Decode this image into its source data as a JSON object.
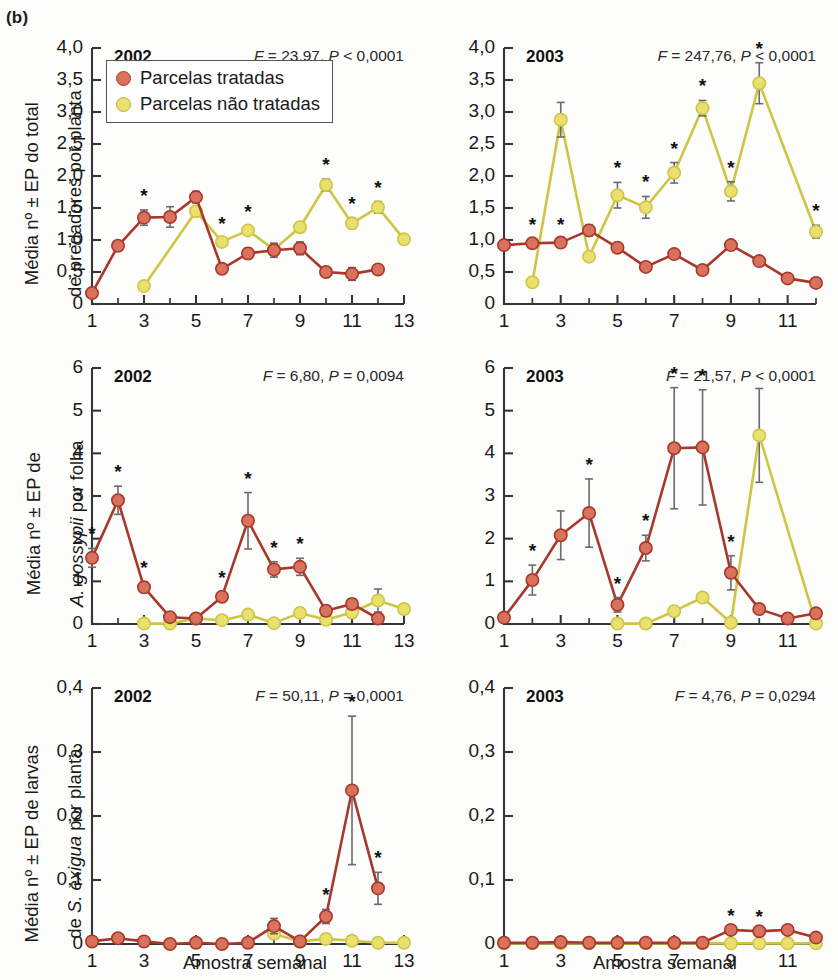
{
  "figure": {
    "panel_label": "(b)",
    "x_axis_title": "Amostra semanal",
    "colors": {
      "treated": "#d9725c",
      "treated_line": "#a8372c",
      "untreated": "#e9e070",
      "untreated_line": "#cfc545",
      "axis": "#35363a",
      "error_bar": "#6a6a70",
      "background": "#fdfdfb"
    },
    "legend": {
      "items": [
        {
          "label": "Parcelas tratadas",
          "color": "#d9725c"
        },
        {
          "label": "Parcelas não tratadas",
          "color": "#e9e070"
        }
      ]
    },
    "significance_marker": "*"
  },
  "chart_data": [
    {
      "id": "predators-2002",
      "type": "line",
      "title": "2002",
      "stats": {
        "F_label": "F",
        "F_value": "23,97",
        "P_label": "P",
        "P_op": "<",
        "P_value": "0,0001",
        "text": "F = 23,97, P < 0,0001"
      },
      "ylabel": "Média nº ± EP do total de predadores por planta",
      "xlabel": "Amostra semanal",
      "ylim": [
        0,
        4.0
      ],
      "xlim": [
        1,
        13
      ],
      "yticks": [
        0,
        0.5,
        1.0,
        1.5,
        2.0,
        2.5,
        3.0,
        3.5,
        4.0
      ],
      "yticklabels": [
        "0",
        "0,5",
        "1,0",
        "1,5",
        "2,0",
        "2,5",
        "3,0",
        "3,5",
        "4,0"
      ],
      "xticks": [
        1,
        3,
        5,
        7,
        9,
        11,
        13
      ],
      "xticklabels": [
        "1",
        "3",
        "5",
        "7",
        "9",
        "11",
        "13"
      ],
      "grid": false,
      "legend_position": "upper-left",
      "series": [
        {
          "name": "Parcelas tratadas",
          "color": "#d9725c",
          "x": [
            1,
            2,
            3,
            4,
            5,
            6,
            7,
            8,
            9,
            10,
            11,
            12
          ],
          "values": [
            0.17,
            0.91,
            1.35,
            1.36,
            1.67,
            0.55,
            0.79,
            0.84,
            0.87,
            0.5,
            0.47,
            0.54
          ],
          "errors": [
            0.0,
            0.07,
            0.12,
            0.16,
            0.09,
            0.07,
            0.08,
            0.11,
            0.1,
            0.06,
            0.1,
            0.06
          ],
          "stars": [
            false,
            false,
            true,
            false,
            false,
            false,
            false,
            false,
            false,
            false,
            false,
            false
          ]
        },
        {
          "name": "Parcelas não tratadas",
          "color": "#e9e070",
          "x": [
            3,
            4,
            5,
            6,
            7,
            8,
            9,
            10,
            11,
            12,
            13
          ],
          "values": [
            0.28,
            null,
            1.45,
            0.97,
            1.15,
            0.85,
            1.2,
            1.86,
            1.26,
            1.51,
            1.01
          ],
          "errors": [
            0.0,
            0.0,
            0.07,
            0.06,
            0.07,
            0.08,
            0.07,
            0.09,
            0.08,
            0.09,
            0.07
          ],
          "stars": [
            false,
            false,
            false,
            true,
            true,
            false,
            false,
            true,
            true,
            true,
            false
          ]
        }
      ]
    },
    {
      "id": "predators-2003",
      "type": "line",
      "title": "2003",
      "stats": {
        "F_label": "F",
        "F_value": "247,76",
        "P_label": "P",
        "P_op": "<",
        "P_value": "0,0001",
        "text": "F = 247,76, P < 0,0001"
      },
      "ylabel": "Média nº ± EP do total de predadores por planta",
      "xlabel": "Amostra semanal",
      "ylim": [
        0,
        4.0
      ],
      "xlim": [
        1,
        12
      ],
      "yticks": [
        0,
        0.5,
        1.0,
        1.5,
        2.0,
        2.5,
        3.0,
        3.5,
        4.0
      ],
      "yticklabels": [
        "0",
        "0,5",
        "1,0",
        "1,5",
        "2,0",
        "2,5",
        "3,0",
        "3,5",
        "4,0"
      ],
      "xticks": [
        1,
        3,
        5,
        7,
        9,
        11
      ],
      "xticklabels": [
        "1",
        "3",
        "5",
        "7",
        "9",
        "11"
      ],
      "grid": false,
      "legend_position": "none",
      "series": [
        {
          "name": "Parcelas tratadas",
          "color": "#d9725c",
          "x": [
            1,
            2,
            3,
            4,
            5,
            6,
            7,
            8,
            9,
            10,
            11,
            12
          ],
          "values": [
            0.92,
            0.95,
            0.96,
            1.15,
            0.88,
            0.58,
            0.78,
            0.53,
            0.92,
            0.67,
            0.4,
            0.33
          ],
          "errors": [
            0.0,
            0.06,
            0.06,
            0.09,
            0.0,
            0.0,
            0.0,
            0.0,
            0.0,
            0.0,
            0.0,
            0.0
          ],
          "stars": [
            false,
            true,
            true,
            false,
            false,
            false,
            false,
            false,
            false,
            false,
            false,
            false
          ]
        },
        {
          "name": "Parcelas não tratadas",
          "color": "#e9e070",
          "x": [
            2,
            3,
            4,
            5,
            6,
            7,
            8,
            9,
            10,
            12
          ],
          "values": [
            0.34,
            2.88,
            0.74,
            1.7,
            1.51,
            2.05,
            3.06,
            1.76,
            3.45,
            1.13
          ],
          "errors": [
            0.0,
            0.27,
            0.07,
            0.2,
            0.17,
            0.16,
            0.12,
            0.15,
            0.32,
            0.1
          ],
          "stars": [
            false,
            false,
            false,
            true,
            true,
            true,
            true,
            true,
            true,
            true
          ]
        }
      ]
    },
    {
      "id": "gossypii-2002",
      "type": "line",
      "title": "2002",
      "stats": {
        "F_label": "F",
        "F_value": "6,80",
        "P_label": "P",
        "P_op": "=",
        "P_value": "0,0094",
        "text": "F = 6,80, P = 0,0094"
      },
      "ylabel": "Média nº ± EP de A. gossypii por folha",
      "xlabel": "Amostra semanal",
      "ylim": [
        0,
        6
      ],
      "xlim": [
        1,
        13
      ],
      "yticks": [
        0,
        1,
        2,
        3,
        4,
        5,
        6
      ],
      "yticklabels": [
        "0",
        "1",
        "2",
        "3",
        "4",
        "5",
        "6"
      ],
      "xticks": [
        1,
        3,
        5,
        7,
        9,
        11,
        13
      ],
      "xticklabels": [
        "1",
        "3",
        "5",
        "7",
        "9",
        "11",
        "13"
      ],
      "grid": false,
      "legend_position": "none",
      "series": [
        {
          "name": "Parcelas tratadas",
          "color": "#d9725c",
          "x": [
            1,
            2,
            3,
            4,
            5,
            6,
            7,
            8,
            9,
            10,
            11,
            12
          ],
          "values": [
            1.55,
            2.9,
            0.86,
            0.16,
            0.13,
            0.64,
            2.42,
            1.28,
            1.34,
            0.31,
            0.47,
            0.13
          ],
          "errors": [
            0.22,
            0.33,
            0.12,
            0.08,
            0.08,
            0.1,
            0.66,
            0.18,
            0.2,
            0.12,
            0.12,
            0.07
          ],
          "stars": [
            true,
            true,
            true,
            false,
            false,
            true,
            true,
            true,
            true,
            false,
            false,
            false
          ]
        },
        {
          "name": "Parcelas não tratadas",
          "color": "#e9e070",
          "x": [
            3,
            4,
            5,
            6,
            7,
            8,
            9,
            10,
            11,
            12,
            13
          ],
          "values": [
            0.01,
            0.01,
            0.13,
            0.09,
            0.22,
            0.02,
            0.26,
            0.1,
            0.27,
            0.55,
            0.35
          ],
          "errors": [
            0.0,
            0.0,
            0.0,
            0.0,
            0.0,
            0.0,
            0.0,
            0.0,
            0.12,
            0.27,
            0.11
          ],
          "stars": [
            false,
            false,
            false,
            false,
            false,
            false,
            false,
            false,
            false,
            false,
            false
          ]
        }
      ]
    },
    {
      "id": "gossypii-2003",
      "type": "line",
      "title": "2003",
      "stats": {
        "F_label": "F",
        "F_value": "21,57",
        "P_label": "P",
        "P_op": "<",
        "P_value": "0,0001",
        "text": "F = 21,57, P < 0,0001"
      },
      "ylabel": "Média nº ± EP de A. gossypii por folha",
      "xlabel": "Amostra semanal",
      "ylim": [
        0,
        6
      ],
      "xlim": [
        1,
        12
      ],
      "yticks": [
        0,
        1,
        2,
        3,
        4,
        5,
        6
      ],
      "yticklabels": [
        "0",
        "1",
        "2",
        "3",
        "4",
        "5",
        "6"
      ],
      "xticks": [
        1,
        3,
        5,
        7,
        9,
        11
      ],
      "xticklabels": [
        "1",
        "3",
        "5",
        "7",
        "9",
        "11"
      ],
      "grid": false,
      "legend_position": "none",
      "series": [
        {
          "name": "Parcelas tratadas",
          "color": "#d9725c",
          "x": [
            1,
            2,
            3,
            4,
            5,
            6,
            7,
            8,
            9,
            10,
            11,
            12
          ],
          "values": [
            0.15,
            1.03,
            2.08,
            2.6,
            0.45,
            1.78,
            4.12,
            4.14,
            1.2,
            0.35,
            0.13,
            0.25
          ],
          "errors": [
            0.0,
            0.35,
            0.57,
            0.8,
            0.17,
            0.3,
            1.42,
            1.35,
            0.4,
            0.0,
            0.0,
            0.0
          ],
          "stars": [
            false,
            true,
            false,
            true,
            true,
            true,
            true,
            true,
            true,
            false,
            false,
            false
          ]
        },
        {
          "name": "Parcelas não tratadas",
          "color": "#e9e070",
          "x": [
            5,
            6,
            7,
            8,
            9,
            10,
            12
          ],
          "values": [
            0.01,
            0.01,
            0.3,
            0.62,
            0.03,
            4.42,
            0.01
          ],
          "errors": [
            0.0,
            0.0,
            0.0,
            0.0,
            0.0,
            1.1,
            0.0
          ],
          "stars": [
            false,
            false,
            false,
            false,
            false,
            false,
            false
          ]
        }
      ]
    },
    {
      "id": "exigua-2002",
      "type": "line",
      "title": "2002",
      "stats": {
        "F_label": "F",
        "F_value": "50,11",
        "P_label": "P",
        "P_op": "=",
        "P_value": "0,0001",
        "text": "F = 50,11, P = 0,0001"
      },
      "ylabel": "Média nº ± EP de larvas de S. exigua por planta",
      "xlabel": "Amostra semanal",
      "ylim": [
        0,
        0.4
      ],
      "xlim": [
        1,
        13
      ],
      "yticks": [
        0,
        0.1,
        0.2,
        0.3,
        0.4
      ],
      "yticklabels": [
        "0",
        "0,1",
        "0,2",
        "0,3",
        "0,4"
      ],
      "xticks": [
        1,
        3,
        5,
        7,
        9,
        11,
        13
      ],
      "xticklabels": [
        "1",
        "3",
        "5",
        "7",
        "9",
        "11",
        "13"
      ],
      "grid": false,
      "legend_position": "none",
      "series": [
        {
          "name": "Parcelas tratadas",
          "color": "#d9725c",
          "x": [
            1,
            2,
            3,
            4,
            5,
            6,
            7,
            8,
            9,
            10,
            11,
            12
          ],
          "values": [
            0.004,
            0.009,
            0.004,
            0.0,
            0.002,
            0.0,
            0.002,
            0.028,
            0.004,
            0.043,
            0.24,
            0.087
          ],
          "errors": [
            0.0,
            0.0,
            0.0,
            0.0,
            0.0,
            0.0,
            0.0,
            0.012,
            0.0,
            0.011,
            0.116,
            0.025
          ],
          "stars": [
            false,
            false,
            false,
            false,
            false,
            false,
            false,
            false,
            false,
            true,
            true,
            true
          ]
        },
        {
          "name": "Parcelas não tratadas",
          "color": "#e9e070",
          "x": [
            8,
            9,
            10,
            11,
            12,
            13
          ],
          "values": [
            0.016,
            0.004,
            0.008,
            0.005,
            0.002,
            0.002
          ],
          "errors": [
            0.0,
            0.0,
            0.0,
            0.0,
            0.0,
            0.0
          ],
          "stars": [
            false,
            false,
            false,
            false,
            false,
            false
          ]
        }
      ]
    },
    {
      "id": "exigua-2003",
      "type": "line",
      "title": "2003",
      "stats": {
        "F_label": "F",
        "F_value": "4,76",
        "P_label": "P",
        "P_op": "=",
        "P_value": "0,0294",
        "text": "F = 4,76, P = 0,0294"
      },
      "ylabel": "Média nº ± EP de larvas de S. exigua por planta",
      "xlabel": "Amostra semanal",
      "ylim": [
        0,
        0.4
      ],
      "xlim": [
        1,
        12
      ],
      "yticks": [
        0,
        0.1,
        0.2,
        0.3,
        0.4
      ],
      "yticklabels": [
        "0",
        "0,1",
        "0,2",
        "0,3",
        "0,4"
      ],
      "xticks": [
        1,
        3,
        5,
        7,
        9,
        11
      ],
      "xticklabels": [
        "1",
        "3",
        "5",
        "7",
        "9",
        "11"
      ],
      "grid": false,
      "legend_position": "none",
      "series": [
        {
          "name": "Parcelas tratadas",
          "color": "#d9725c",
          "x": [
            1,
            2,
            3,
            4,
            5,
            6,
            7,
            8,
            9,
            10,
            11,
            12
          ],
          "values": [
            0.002,
            0.002,
            0.003,
            0.002,
            0.002,
            0.002,
            0.002,
            0.002,
            0.022,
            0.02,
            0.022,
            0.01
          ],
          "errors": [
            0.0,
            0.0,
            0.0,
            0.0,
            0.0,
            0.0,
            0.0,
            0.0,
            0.0,
            0.0,
            0.0,
            0.0
          ],
          "stars": [
            false,
            false,
            false,
            false,
            false,
            false,
            false,
            false,
            true,
            true,
            false,
            false
          ]
        },
        {
          "name": "Parcelas não tratadas",
          "color": "#e9e070",
          "x": [
            1,
            2,
            3,
            4,
            5,
            6,
            7,
            8,
            9,
            10,
            11,
            12
          ],
          "values": [
            0.001,
            0.001,
            0.001,
            0.001,
            0.001,
            0.001,
            0.001,
            0.001,
            0.001,
            0.001,
            0.001,
            0.001
          ],
          "errors": [
            0.0,
            0.0,
            0.0,
            0.0,
            0.0,
            0.0,
            0.0,
            0.0,
            0.0,
            0.0,
            0.0,
            0.0
          ],
          "stars": [
            false,
            false,
            false,
            false,
            false,
            false,
            false,
            false,
            false,
            false,
            false,
            false
          ]
        }
      ]
    }
  ],
  "ylabels": {
    "row1_line1": "Média nº ± EP do total",
    "row1_line2": "de predadores por planta",
    "row2_line1": "Média nº ± EP de",
    "row2_line2a": "A. gossypii",
    "row2_line2b": " por folha",
    "row3_line1": "Média nº ± EP de larvas",
    "row3_line2a": "de ",
    "row3_line2b": "S. exigua",
    "row3_line2c": " por planta"
  }
}
